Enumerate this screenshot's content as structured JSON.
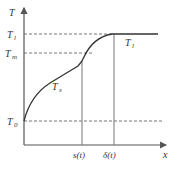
{
  "diagram": {
    "axes": {
      "y_label": "T",
      "x_label": "x"
    },
    "levels": [
      {
        "id": "Tl",
        "label": "T",
        "sub": "l"
      },
      {
        "id": "Tm",
        "label": "T",
        "sub": "m"
      },
      {
        "id": "T0",
        "label": "T",
        "sub": "0"
      }
    ],
    "x_marks": [
      {
        "id": "s",
        "label": "s(t)"
      },
      {
        "id": "delta",
        "label": "δ(t)"
      }
    ],
    "curve_labels": [
      {
        "id": "Ts",
        "label": "T",
        "sub": "s"
      },
      {
        "id": "Tl_curve",
        "label": "T",
        "sub": "l"
      }
    ],
    "colors": {
      "axis": "#555555",
      "curve": "#333333",
      "dashed": "#666666"
    }
  }
}
